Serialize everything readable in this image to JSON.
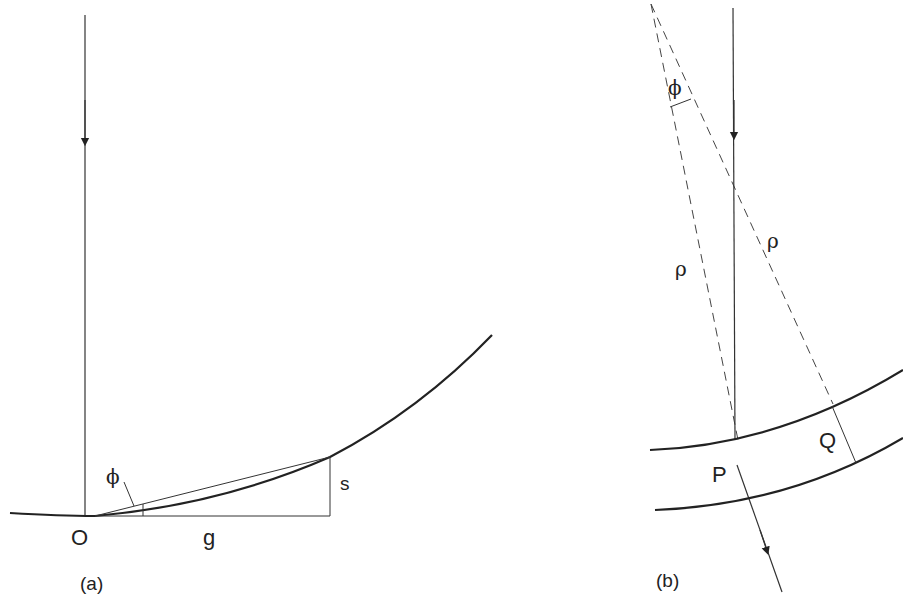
{
  "figure": {
    "panel_a": {
      "caption": "(a)",
      "labels": {
        "origin": "O",
        "horizontal": "g",
        "vertical": "s",
        "angle": "ϕ"
      }
    },
    "panel_b": {
      "caption": "(b)",
      "labels": {
        "angle": "ϕ",
        "radius_left": "ρ",
        "radius_right": "ρ",
        "point_p": "P",
        "point_q": "Q"
      }
    },
    "colors": {
      "stroke": "#222222",
      "background": "#ffffff"
    }
  }
}
